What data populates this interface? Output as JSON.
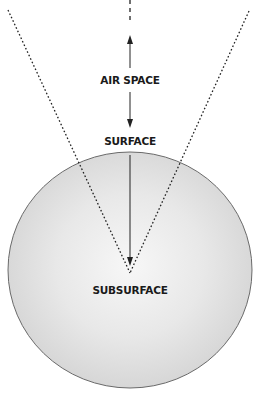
{
  "diagram": {
    "labels": {
      "air_space": "AIR SPACE",
      "surface": "SURFACE",
      "subsurface": "SUBSURFACE"
    },
    "colors": {
      "sphere_center": "#f6f6f6",
      "sphere_edge": "#d6d6d6",
      "sphere_outline": "#6a6a6a",
      "line": "#222222"
    }
  }
}
